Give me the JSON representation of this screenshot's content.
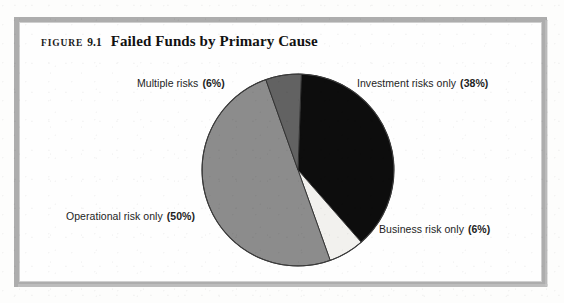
{
  "figure": {
    "label_word": "FIGURE",
    "number": "9.1",
    "title": "Failed Funds by Primary Cause"
  },
  "chart_data": {
    "type": "pie",
    "title": "Failed Funds by Primary Cause",
    "xlabel": "",
    "ylabel": "",
    "legend_position": "callout-labels",
    "grid": false,
    "total": 100,
    "units": "percent",
    "start_angle_deg": 2,
    "direction": "clockwise",
    "categories": [
      "Investment risks only",
      "Business risk only",
      "Operational risk only",
      "Multiple risks"
    ],
    "values": [
      38,
      6,
      50,
      6
    ],
    "colors": [
      "#0d0d0d",
      "#f2f1ee",
      "#8c8c8c",
      "#626262"
    ],
    "slices": [
      {
        "name": "Investment risks only",
        "value": 38,
        "percent_text": "(38%)",
        "color": "#0d0d0d",
        "label": "Investment risks only",
        "label_position": "upper-right"
      },
      {
        "name": "Business risk only",
        "value": 6,
        "percent_text": "(6%)",
        "color": "#f2f1ee",
        "label": "Business risk only",
        "label_position": "lower-right"
      },
      {
        "name": "Operational risk only",
        "value": 50,
        "percent_text": "(50%)",
        "color": "#8c8c8c",
        "label": "Operational risk only",
        "label_position": "left"
      },
      {
        "name": "Multiple risks",
        "value": 6,
        "percent_text": "(6%)",
        "color": "#626262",
        "label": "Multiple risks",
        "label_position": "upper-left"
      }
    ]
  },
  "geometry": {
    "center_x": 298,
    "center_y": 170,
    "radius": 96
  },
  "frame": {
    "border_color": "#adadad"
  }
}
